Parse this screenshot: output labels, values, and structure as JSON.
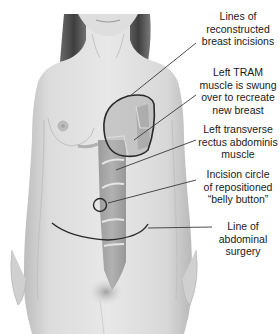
{
  "diagram": {
    "labels": [
      {
        "id": "breast-incisions",
        "lines": [
          "Lines of",
          "reconstructed",
          "breast incisions"
        ]
      },
      {
        "id": "tram-muscle",
        "lines": [
          "Left TRAM",
          "muscle is swung",
          "over to recreate",
          "new breast"
        ]
      },
      {
        "id": "rectus-muscle",
        "lines": [
          "Left transverse",
          "rectus abdominis",
          "muscle"
        ]
      },
      {
        "id": "belly-button",
        "lines": [
          "Incision circle",
          "of repositioned",
          "“belly button”"
        ]
      },
      {
        "id": "abdominal-line",
        "lines": [
          "Line of",
          "abdominal",
          "surgery"
        ]
      }
    ],
    "colors": {
      "skin": "#e4e4e4",
      "skin_shadow": "#c9c9c9",
      "muscle": "#9a9a9a",
      "outline": "#2b2b2b",
      "hair": "#5a5a5a",
      "text": "#1a1a1a"
    }
  }
}
